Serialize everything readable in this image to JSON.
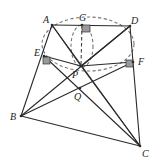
{
  "diagram": {
    "type": "geometry-figure",
    "points": {
      "A": {
        "x": 52,
        "y": 25,
        "label": "A",
        "lx": 43,
        "ly": 23
      },
      "G": {
        "x": 82,
        "y": 25,
        "label": "G",
        "lx": 79,
        "ly": 21
      },
      "D": {
        "x": 130,
        "y": 26,
        "label": "D",
        "lx": 131,
        "ly": 24
      },
      "E": {
        "x": 44,
        "y": 56,
        "label": "E",
        "lx": 34,
        "ly": 56
      },
      "P": {
        "x": 81,
        "y": 66,
        "label": "P",
        "lx": 72,
        "ly": 78
      },
      "F": {
        "x": 133,
        "y": 62,
        "label": "F",
        "lx": 138,
        "ly": 65
      },
      "Q": {
        "x": 80,
        "y": 88,
        "label": "Q",
        "lx": 74,
        "ly": 100
      },
      "B": {
        "x": 21,
        "y": 116,
        "label": "B",
        "lx": 10,
        "ly": 120
      },
      "C": {
        "x": 140,
        "y": 146,
        "label": "C",
        "lx": 142,
        "ly": 157
      }
    },
    "segments": [
      [
        "A",
        "D"
      ],
      [
        "A",
        "B"
      ],
      [
        "B",
        "C"
      ],
      [
        "D",
        "C"
      ],
      [
        "A",
        "C"
      ],
      [
        "B",
        "D"
      ],
      [
        "E",
        "P"
      ],
      [
        "P",
        "F"
      ],
      [
        "E",
        "C"
      ],
      [
        "B",
        "F"
      ],
      [
        "A",
        "P"
      ],
      [
        "P",
        "D"
      ],
      [
        "P",
        "C"
      ]
    ],
    "dashed_segments": [
      [
        "G",
        "P"
      ]
    ],
    "right_angles": [
      "G",
      "E",
      "F"
    ],
    "circles": [
      {
        "name": "circle-AEPFD",
        "cx": 88,
        "cy": 44,
        "rx": 46,
        "ry": 27
      },
      {
        "name": "circle-GP",
        "cx": 82,
        "cy": 46,
        "rx": 11,
        "ry": 21
      }
    ],
    "labels": [
      "A",
      "G",
      "D",
      "E",
      "P",
      "F",
      "Q",
      "B",
      "C"
    ]
  }
}
